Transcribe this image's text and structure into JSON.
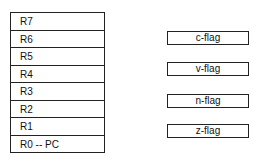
{
  "registers": [
    "R7",
    "R6",
    "R5",
    "R4",
    "R3",
    "R2",
    "R1",
    "R0 -- PC"
  ],
  "flags": [
    "c-flag",
    "v-flag",
    "n-flag",
    "z-flag"
  ]
}
